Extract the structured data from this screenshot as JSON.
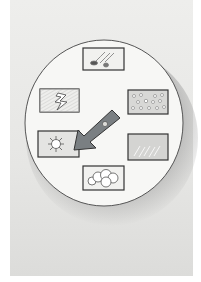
{
  "illustration": {
    "subject": "weather selector dial",
    "colors": {
      "paper": "#e8e8e6",
      "dial_face": "#f7f7f5",
      "outline": "#555555",
      "arrow_fill": "#7a7f82",
      "arrow_rivet": "#dcdcd8"
    },
    "dial": {
      "cx": 104,
      "cy": 123,
      "rx": 79,
      "ry": 83
    },
    "tiles": [
      {
        "name": "windy-hail",
        "icon": "wind-hail-icon",
        "x": 83,
        "y": 48,
        "w": 41,
        "h": 22
      },
      {
        "name": "lightning",
        "icon": "lightning-icon",
        "x": 40,
        "y": 89,
        "w": 39,
        "h": 23
      },
      {
        "name": "snow",
        "icon": "snow-icon",
        "x": 128,
        "y": 90,
        "w": 40,
        "h": 24
      },
      {
        "name": "sunny",
        "icon": "sun-icon",
        "x": 38,
        "y": 131,
        "w": 41,
        "h": 26
      },
      {
        "name": "rain",
        "icon": "rain-icon",
        "x": 128,
        "y": 134,
        "w": 40,
        "h": 26
      },
      {
        "name": "cloudy",
        "icon": "cloud-icon",
        "x": 83,
        "y": 166,
        "w": 41,
        "h": 24
      }
    ],
    "pointer": {
      "points_to": "sunny"
    }
  }
}
